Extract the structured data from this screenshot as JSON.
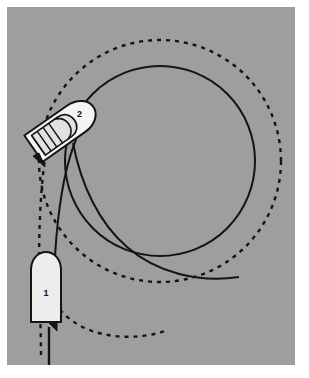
{
  "figure": {
    "panel_color": "#9e9e9e",
    "background_color": "#ffffff",
    "ink_color": "#111111",
    "hull_fill": "#ededed",
    "caption_partial": "",
    "labels": [
      {
        "id": "boat-1",
        "text": "1",
        "x": 46,
        "y": 289
      },
      {
        "id": "boat-2",
        "text": "2",
        "x": 76,
        "y": 120
      }
    ],
    "boats": [
      {
        "name": "boat-1",
        "label": "1",
        "heading_deg": 0,
        "center_x": 46,
        "center_y": 287,
        "length": 78,
        "beam": 31
      },
      {
        "name": "boat-2",
        "label": "2",
        "heading_deg": 55,
        "center_x": 62,
        "center_y": 128,
        "length": 78,
        "beam": 31
      }
    ],
    "paths": [
      {
        "name": "outer-turning-circle",
        "style": "dashed",
        "center_x": 160,
        "center_y": 161,
        "radius": 121
      },
      {
        "name": "inner-turning-circle",
        "style": "solid",
        "center_x": 160,
        "center_y": 161,
        "radius": 95
      },
      {
        "name": "approach-track-solid",
        "style": "solid"
      },
      {
        "name": "approach-track-dashed",
        "style": "dashed"
      }
    ]
  }
}
